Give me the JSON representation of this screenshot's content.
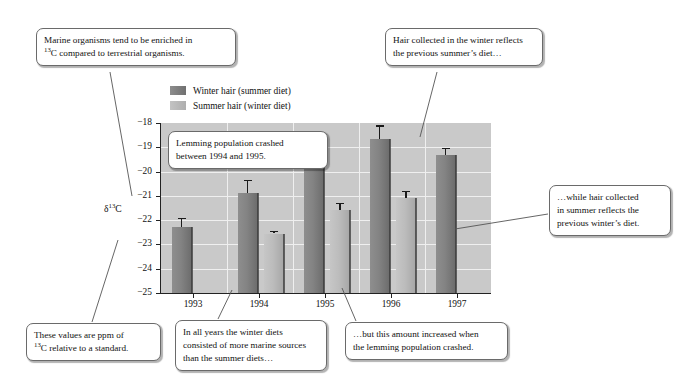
{
  "chart_data": {
    "type": "bar",
    "title": "",
    "xlabel": "",
    "ylabel": "δ¹³C",
    "ylabel_main": "δ",
    "ylabel_sup": "13",
    "ylabel_tail": "C",
    "ylim": [
      -25,
      -18
    ],
    "ytick_labels": [
      "−18",
      "−19",
      "−20",
      "−21",
      "−22",
      "−23",
      "−24",
      "−25"
    ],
    "ytick_values": [
      -18,
      -19,
      -20,
      -21,
      -22,
      -23,
      -24,
      -25
    ],
    "grid": true,
    "legend_position": "above-plot-left",
    "categories": [
      "1993",
      "1994",
      "1995",
      "1996",
      "1997"
    ],
    "series": [
      {
        "name": "Winter hair (summer diet)",
        "color": "#808080",
        "values": [
          -22.3,
          -20.9,
          -19.05,
          -18.65,
          -19.3
        ],
        "errors": [
          0.38,
          0.55,
          0.3,
          0.55,
          0.28
        ]
      },
      {
        "name": "Summer hair (winter diet)",
        "color": "#bdbdbd",
        "values": [
          null,
          -22.55,
          -21.6,
          -21.1,
          null
        ],
        "errors": [
          null,
          0.1,
          0.32,
          0.3,
          null
        ]
      }
    ]
  },
  "legend": {
    "items": [
      {
        "label": "Winter hair (summer diet)",
        "swatch": "winter"
      },
      {
        "label": "Summer hair (winter diet)",
        "swatch": "summer"
      }
    ]
  },
  "callouts": [
    {
      "id": "marine-enrichment",
      "line1": "Marine organisms tend to be enriched in",
      "line2_pre": "",
      "line2_sup": "13",
      "line2_post": "C compared to terrestrial organisms."
    },
    {
      "id": "winter-hair-reflects",
      "line1": "Hair collected in the winter reflects",
      "line2": "the previous summer’s diet…"
    },
    {
      "id": "lemming-crash",
      "line1": "Lemming population crashed",
      "line2": "between 1994 and 1995."
    },
    {
      "id": "summer-hair-reflects",
      "line1": "…while hair collected",
      "line2": "in summer reflects the",
      "line3": "previous winter’s diet."
    },
    {
      "id": "ppm-standard",
      "line1": "These values are ppm of",
      "line2_pre": "",
      "line2_sup": "13",
      "line2_post": "C relative to a standard."
    },
    {
      "id": "winter-more-marine",
      "line1": "In all years the winter diets",
      "line2": "consisted of more marine sources",
      "line3": "than the summer diets…"
    },
    {
      "id": "amount-increased",
      "line1": "…but this amount increased when",
      "line2": "the lemming population crashed."
    }
  ],
  "colors": {
    "plot_background": "#c9c9c9",
    "gridline": "#efefef",
    "axis": "#222222",
    "winter_bar": "#808080",
    "summer_bar": "#bdbdbd",
    "callout_border": "#6a6a6a",
    "page_background": "#ffffff"
  }
}
